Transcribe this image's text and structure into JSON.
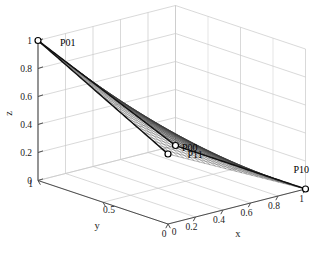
{
  "figure": {
    "kind": "3d-mesh-surface-plot",
    "background_color": "#ffffff",
    "mesh_color": "#3a3a3a",
    "grid_color": "#c8c8c8",
    "axis_color": "#4d4d4d",
    "marker_color": "#000000",
    "edge_color": "#111111"
  },
  "axes": {
    "x": {
      "label": "x",
      "ticks": [
        "0",
        "0.2",
        "0.4",
        "0.6",
        "0.8",
        "1"
      ],
      "values": [
        0,
        0.2,
        0.4,
        0.6,
        0.8,
        1
      ],
      "range": [
        0,
        1
      ]
    },
    "y": {
      "label": "y",
      "ticks": [
        "0",
        "0.5",
        "1"
      ],
      "values": [
        0,
        0.5,
        1
      ],
      "range": [
        0,
        1
      ]
    },
    "z": {
      "label": "z",
      "ticks": [
        "0",
        "0.2",
        "0.4",
        "0.6",
        "0.8",
        "1"
      ],
      "values": [
        0,
        0.2,
        0.4,
        0.6,
        0.8,
        1
      ],
      "range": [
        0,
        1
      ]
    }
  },
  "chart_data": {
    "type": "surface",
    "title": "",
    "xlabel": "x",
    "ylabel": "y",
    "zlabel": "z",
    "xlim": [
      0,
      1
    ],
    "ylim": [
      0,
      1
    ],
    "zlim": [
      0,
      1
    ],
    "grid": true,
    "legend": "none",
    "surface_kind": "bilinear-ruled-patch",
    "mesh_divisions": 26,
    "control_points": [
      {
        "name": "P00",
        "x": 0,
        "y": 0,
        "z": 0.5
      },
      {
        "name": "P01",
        "x": 0,
        "y": 1,
        "z": 1.0
      },
      {
        "name": "P10",
        "x": 1,
        "y": 0,
        "z": 0.0
      },
      {
        "name": "P11",
        "x": 1,
        "y": 1,
        "z": 0.0
      }
    ],
    "annotations": [
      {
        "text": "P00",
        "anchor": "P00"
      },
      {
        "text": "P01",
        "anchor": "P01"
      },
      {
        "text": "P10",
        "anchor": "P10"
      },
      {
        "text": "P11",
        "anchor": "P11"
      }
    ]
  },
  "point_labels": {
    "p00": "P00",
    "p01": "P01",
    "p10": "P10",
    "p11": "P11"
  },
  "view": {
    "azimuth_hint": "front-right",
    "elevation_hint": "low"
  }
}
